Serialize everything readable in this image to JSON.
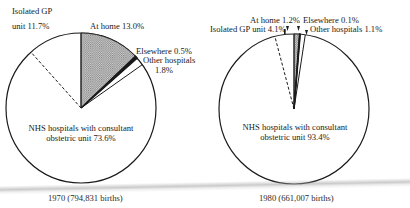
{
  "chart_data": [
    {
      "type": "pie",
      "title": "1970 (794,831 births)",
      "start_angle_deg": 0,
      "direction": "clockwise",
      "slices": [
        {
          "name": "At home",
          "label": "At home 13.0%",
          "value": 13.0,
          "fill": "hatched"
        },
        {
          "name": "Elsewhere",
          "label": "Elsewhere 0.5%",
          "value": 0.5,
          "fill": "black"
        },
        {
          "name": "Other hospitals",
          "label": "Other hospitals 1.8%",
          "value": 1.8,
          "fill": "white"
        },
        {
          "name": "NHS hospitals with consultant obstetric unit",
          "label": "NHS hospitals with consultant obstetric unit 73.6%",
          "value": 73.6,
          "fill": "white"
        },
        {
          "name": "Isolated GP unit",
          "label": "Isolated GP unit 11.7%",
          "value": 11.7,
          "fill": "white",
          "boundary": "dashed"
        }
      ]
    },
    {
      "type": "pie",
      "title": "1980 (661,007 births)",
      "start_angle_deg": 0,
      "direction": "clockwise",
      "slices": [
        {
          "name": "At home",
          "label": "At home 1.2%",
          "value": 1.2,
          "fill": "hatched"
        },
        {
          "name": "Elsewhere",
          "label": "Elsewhere 0.1%",
          "value": 0.1,
          "fill": "black"
        },
        {
          "name": "Other hospitals",
          "label": "Other hospitals 1.1%",
          "value": 1.1,
          "fill": "white"
        },
        {
          "name": "NHS hospitals with consultant obstetric unit",
          "label": "NHS hospitals with consultant obstetric unit 93.4%",
          "value": 93.4,
          "fill": "white"
        },
        {
          "name": "Isolated GP unit",
          "label": "Isolated GP unit 4.1%",
          "value": 4.1,
          "fill": "white",
          "boundary": "dashed"
        }
      ]
    }
  ],
  "pie1970": {
    "caption": "1970 (794,831 births)",
    "labels": {
      "isolated_line1": "Isolated GP",
      "isolated_line2": "unit 11.7%",
      "home": "At home 13.0%",
      "elsewhere": "Elsewhere 0.5%",
      "other_line1": "Other hospitals",
      "other_line2": "1.8%",
      "nhs_line1": "NHS hospitals with consultant",
      "nhs_line2": "obstetric unit 73.6%"
    }
  },
  "pie1980": {
    "caption": "1980 (661,007 births)",
    "labels": {
      "home": "At home 1.2%",
      "elsewhere": "Elsewhere 0.1%",
      "isolated": "Isolated GP unit 4.1%",
      "other": "Other hospitals 1.1%",
      "nhs_line1": "NHS hospitals with consultant",
      "nhs_line2": "obstetric unit 93.4%"
    }
  },
  "colors": {
    "ink": "#1a1a1a",
    "hatch": "#9a9a9a",
    "background": "#ffffff"
  }
}
